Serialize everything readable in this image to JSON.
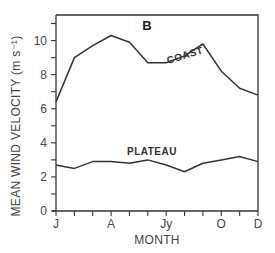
{
  "chart_data": {
    "type": "line",
    "title": "B",
    "xlabel": "MONTH",
    "ylabel": "MEAN WIND VELOCITY (m s⁻¹)",
    "ylim": [
      0,
      11.5
    ],
    "yticks_major": [
      0,
      2,
      4,
      6,
      8,
      10
    ],
    "yticks_minor": [
      1,
      3,
      5,
      7,
      9,
      11
    ],
    "x": [
      "J",
      "F",
      "M",
      "A",
      "M",
      "J",
      "Jy",
      "A",
      "S",
      "O",
      "N",
      "D"
    ],
    "xtick_labels": [
      {
        "index": 0,
        "label": "J"
      },
      {
        "index": 3,
        "label": "A"
      },
      {
        "index": 6,
        "label": "Jy"
      },
      {
        "index": 9,
        "label": "O"
      },
      {
        "index": 11,
        "label": "D"
      }
    ],
    "grid": false,
    "series": [
      {
        "name": "COAST",
        "values": [
          6.4,
          9.0,
          9.7,
          10.3,
          9.9,
          8.7,
          8.7,
          9.1,
          9.8,
          8.2,
          7.2,
          6.8
        ]
      },
      {
        "name": "PLATEAU",
        "values": [
          2.7,
          2.5,
          2.9,
          2.9,
          2.8,
          3.0,
          2.7,
          2.3,
          2.8,
          3.0,
          3.2,
          2.9
        ]
      }
    ]
  }
}
